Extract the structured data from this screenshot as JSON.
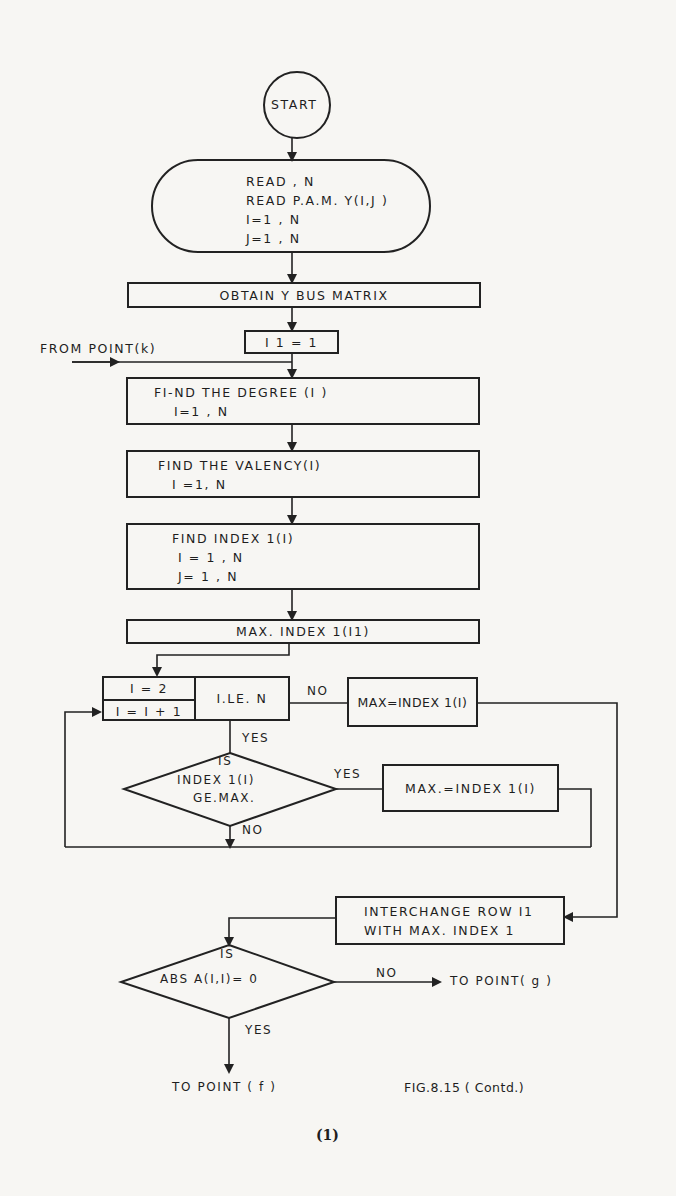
{
  "figure": {
    "caption": "FIG.8.15 ( Contd.)",
    "sub_label": "(1)"
  },
  "nodes": {
    "start": "START",
    "read": [
      "READ , N",
      "READ P.A.M. Y(I,J )",
      "I=1 , N",
      "J=1 , N"
    ],
    "obtain_ybus": "OBTAIN  Y  BUS  MATRIX",
    "init_i1": "I 1 = 1",
    "find_degree": [
      "FI-ND  THE  DEGREE (I )",
      "I=1 , N"
    ],
    "find_valency": [
      "FIND THE  VALENCY(I)",
      "I =1, N"
    ],
    "find_index": [
      "FIND   INDEX 1(I)",
      "I = 1 , N",
      "J= 1 , N"
    ],
    "max_index": "MAX.  INDEX 1(I1)",
    "loop_init": "I = 2",
    "loop_incr": "I = I + 1",
    "loop_test": "I.LE. N",
    "max_assign_no": "MAX=INDEX 1(I)",
    "decision_ge": [
      "IS",
      "INDEX 1(I)",
      "GE.MAX."
    ],
    "max_assign_yes": "MAX.=INDEX 1(I)",
    "interchange": [
      "INTERCHANGE  ROW  I1",
      "WITH  MAX. INDEX  1"
    ],
    "decision_abs": [
      "IS",
      "ABS  A(I,I)= 0"
    ]
  },
  "labels": {
    "from_point_k": "FROM POINT(k)",
    "no_1": "NO",
    "yes_1": "YES",
    "yes_2": "YES",
    "no_2": "NO",
    "no_3": "NO",
    "yes_3": "YES",
    "to_point_g": "TO POINT( g )",
    "to_point_f": "TO  POINT  ( f )"
  }
}
